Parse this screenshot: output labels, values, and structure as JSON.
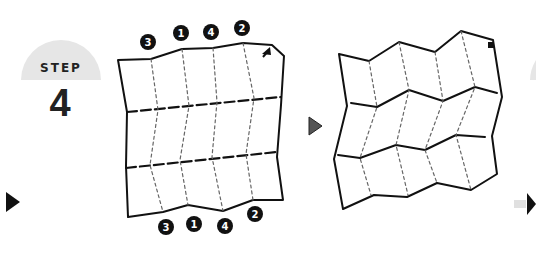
{
  "step": {
    "label": "STEP",
    "number": "4"
  },
  "left_diagram": {
    "top_markers": [
      "3",
      "1",
      "4",
      "2"
    ],
    "bottom_markers": [
      "3",
      "1",
      "4",
      "2"
    ],
    "corner_icon": "arrow-icon"
  },
  "right_diagram": {
    "corner_icon": "arrow-icon"
  },
  "colors": {
    "line": "#111111",
    "badge": "#e6e6e6",
    "arrow_mid": "#555555",
    "marker_bg": "#111111",
    "marker_fg": "#ffffff"
  }
}
